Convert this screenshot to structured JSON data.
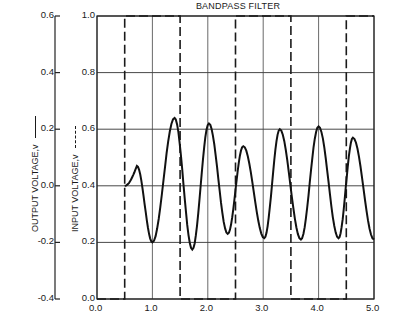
{
  "chart_data": {
    "type": "line",
    "title": "BANDPASS FILTER",
    "xlabel": "",
    "ylabel_left_outer": "OUTPUT VOLTAGE,v",
    "ylabel_left_inner": "INPUT VOLTAGE,v",
    "xlim": [
      0.0,
      5.0
    ],
    "ylim_input": [
      0.0,
      1.0
    ],
    "ylim_output": [
      -0.4,
      0.6
    ],
    "x_ticks": [
      "0.0",
      "1.0",
      "2.0",
      "3.0",
      "4.0",
      "5.0"
    ],
    "y_ticks_input": [
      "0.0",
      "0.2",
      "0.4",
      "0.6",
      "0.8",
      "1.0"
    ],
    "y_ticks_output": [
      "-0.4",
      "-0.2",
      "0.0",
      "0.2",
      "0.4",
      "0.6"
    ],
    "grid": true,
    "series": [
      {
        "name": "Input voltage (square wave)",
        "style": "dashed",
        "axis": "input",
        "x": [
          0.0,
          0.5,
          0.5,
          1.5,
          1.5,
          2.5,
          2.5,
          3.5,
          3.5,
          4.5,
          4.5,
          5.0
        ],
        "y": [
          0.0,
          0.0,
          1.0,
          1.0,
          0.0,
          0.0,
          1.0,
          1.0,
          0.0,
          0.0,
          1.0,
          1.0
        ]
      },
      {
        "name": "Output voltage",
        "style": "solid",
        "axis": "output",
        "x": [
          0.5,
          0.72,
          1.0,
          1.4,
          1.72,
          2.02,
          2.36,
          2.64,
          3.02,
          3.3,
          3.68,
          4.0,
          4.36,
          4.62,
          5.0
        ],
        "y": [
          0.0,
          0.07,
          -0.2,
          0.24,
          -0.225,
          0.22,
          -0.17,
          0.14,
          -0.185,
          0.2,
          -0.19,
          0.21,
          -0.185,
          0.17,
          -0.19
        ]
      }
    ]
  }
}
